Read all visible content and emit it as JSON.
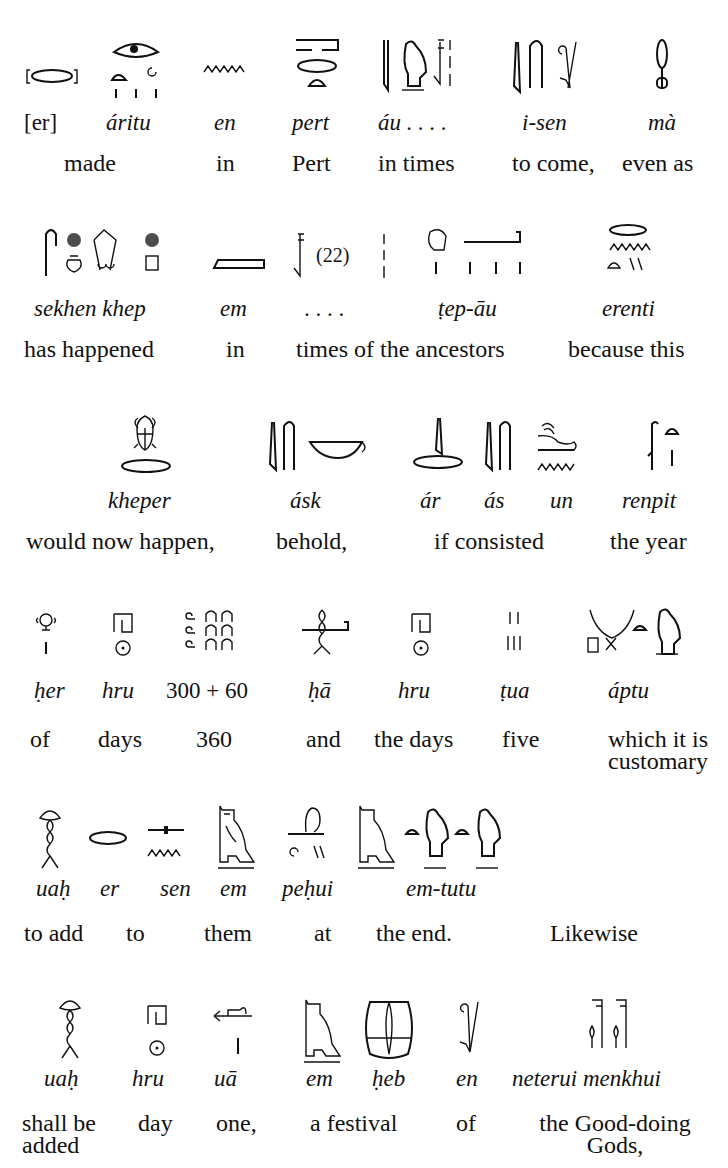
{
  "page": {
    "page_number_fragment": "",
    "lines": [
      {
        "transliterations": [
          "[er]",
          "áritu",
          "en",
          "pert",
          "áu . . . .",
          "i-sen",
          "mà"
        ],
        "translations": [
          "made",
          "in",
          "Pert",
          "in times",
          "to come,",
          "even as"
        ],
        "glyph_notes": [
          "mouth (bracketed)",
          "eye over bread, rope, plural strokes",
          "water ripple",
          "house over mouth and bread",
          "reed, quail chick, lacuna mark",
          "reed, rush, sling",
          "ankh-like loop"
        ]
      },
      {
        "transliterations": [
          "sekhen khep",
          "em",
          ". . . .",
          "ṭep-āu",
          "erenti"
        ],
        "translations": [
          "has happened",
          "in",
          "times of the ancestors",
          "because this"
        ],
        "glyph_notes": [
          "rush, placenta, pot, scarab-like, stand",
          "owl-slab",
          "lacuna (22)",
          "head with arm and plural",
          "mouth water bread strokes"
        ],
        "lacuna_label": "(22)"
      },
      {
        "transliterations": [
          "kheper",
          "ásk",
          "ár",
          "ás",
          "un",
          "renpit"
        ],
        "translations": [
          "would now happen,",
          "behold,",
          "if consisted",
          "the year"
        ],
        "glyph_notes": [
          "scarab over mouth",
          "reed, rush, basket",
          "reed over mouth",
          "reed rush",
          "hare over water",
          "palm branch with bread"
        ]
      },
      {
        "transliterations": [
          "ḥer",
          "hru",
          "300 + 60",
          "ḥā",
          "hru",
          "ṭua",
          "áptu"
        ],
        "translations": [
          "of",
          "days",
          "360",
          "and",
          "the days",
          "five",
          "which it is customary"
        ],
        "glyph_notes": [
          "face over stroke",
          "shelter over sun",
          "three hundreds and six tens",
          "arm-cord",
          "shelter over sun",
          "five strokes",
          "horns, square, cross, bread, chick"
        ]
      },
      {
        "transliterations": [
          "uaḥ",
          "er",
          "sen",
          "em",
          "peḥui",
          "em-tutu"
        ],
        "translations": [
          "to add",
          "to",
          "them",
          "at",
          "the end.",
          "Likewise"
        ],
        "glyph_notes": [
          "twisted cord",
          "mouth",
          "arrow over water",
          "owl",
          "hindquarters, wick, strokes",
          "owl, bread, chick, bread, chick"
        ]
      },
      {
        "transliterations": [
          "uaḥ",
          "hru",
          "uā",
          "em",
          "ḥeb",
          "en",
          "neterui menkhui"
        ],
        "translations": [
          "shall be added",
          "day",
          "one,",
          "a festival",
          "of",
          "the Good-doing Gods,"
        ],
        "glyph_notes": [
          "twisted cord",
          "shelter over sun",
          "harpoon over stroke",
          "owl",
          "festival bowl",
          "sling",
          "two gods flags with hearts"
        ]
      }
    ]
  }
}
